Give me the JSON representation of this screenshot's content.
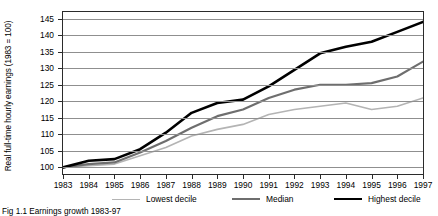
{
  "figure": {
    "caption": "Fig 1.1 Earnings growth 1983-97"
  },
  "axes": {
    "ylabel": "Real full-time hourly earnings (1983 = 100)",
    "xlabel": "",
    "yticks": [
      100,
      105,
      110,
      115,
      120,
      125,
      130,
      135,
      140,
      145
    ],
    "xticks": [
      "1983",
      "1984",
      "1985",
      "1986",
      "1987",
      "1988",
      "1989",
      "1990",
      "1991",
      "1992",
      "1993",
      "1994",
      "1995",
      "1996",
      "1997"
    ]
  },
  "legend": [
    {
      "label": "Lowest decile",
      "color": "#b4b4b4",
      "width": 1.6
    },
    {
      "label": "Median",
      "color": "#6e6e6e",
      "width": 2.2
    },
    {
      "label": "Highest decile",
      "color": "#000000",
      "width": 2.6
    }
  ],
  "chart_data": {
    "type": "line",
    "title": "",
    "xlabel": "",
    "ylabel": "Real full-time hourly earnings (1983 = 100)",
    "x": [
      1983,
      1984,
      1985,
      1986,
      1987,
      1988,
      1989,
      1990,
      1991,
      1992,
      1993,
      1994,
      1995,
      1996,
      1997
    ],
    "categories": [
      "1983",
      "1984",
      "1985",
      "1986",
      "1987",
      "1988",
      "1989",
      "1990",
      "1991",
      "1992",
      "1993",
      "1994",
      "1995",
      "1996",
      "1997"
    ],
    "xlim": [
      1983,
      1997
    ],
    "ylim": [
      98,
      147
    ],
    "grid": true,
    "legend_position": "bottom",
    "series": [
      {
        "name": "Lowest decile",
        "color": "#b4b4b4",
        "values": [
          100,
          100.5,
          101,
          103.5,
          106,
          109.5,
          111.5,
          113,
          116,
          117.5,
          118.5,
          119.5,
          117.5,
          118.5,
          121
        ]
      },
      {
        "name": "Median",
        "color": "#6e6e6e",
        "values": [
          100,
          101,
          101.5,
          104.5,
          108,
          112,
          115.5,
          117.5,
          121,
          123.5,
          125,
          125,
          125.5,
          127.5,
          132
        ]
      },
      {
        "name": "Highest decile",
        "color": "#000000",
        "values": [
          100,
          102,
          102.5,
          105.5,
          110.5,
          116.5,
          119.5,
          120.5,
          124.5,
          129.5,
          134.5,
          136.5,
          138,
          141,
          144
        ]
      }
    ]
  }
}
